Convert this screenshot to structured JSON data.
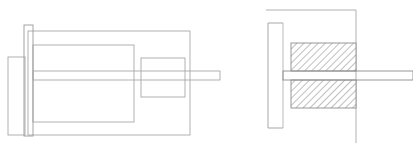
{
  "drawing": {
    "title": "Mechanical Assembly Technical Drawing",
    "description": "Two orthographic engineering views of a shaft-mounted assembly: left side elevation and right sectional view with hatching.",
    "canvas": {
      "width": 413,
      "height": 150,
      "background": "#ffffff"
    },
    "style": {
      "line_color": "#a8a8a8",
      "line_color_dark": "#8d8d8d",
      "hatch_color": "#8a8a8a",
      "fill_color": "#ffffff",
      "stroke_width": 0.9
    },
    "views": [
      {
        "id": "left-elevation-view",
        "name": "Side Elevation View",
        "label": "",
        "parts": [
          {
            "id": "outer-body-rect",
            "name": "outer-body-rectangle",
            "x": 28,
            "y": 31,
            "w": 162,
            "h": 104
          },
          {
            "id": "inner-body-rect",
            "name": "inner-body-rectangle",
            "x": 33,
            "y": 45,
            "w": 101,
            "h": 77
          },
          {
            "id": "mounting-flange-rect",
            "name": "mounting-flange-plate",
            "x": 24,
            "y": 25,
            "w": 9,
            "h": 111
          },
          {
            "id": "rear-housing-rect",
            "name": "rear-housing-block",
            "x": 8,
            "y": 57,
            "w": 17,
            "h": 78
          },
          {
            "id": "boss-rect",
            "name": "shaft-boss-rectangle",
            "x": 141,
            "y": 58,
            "w": 44,
            "h": 39
          },
          {
            "id": "shaft-band",
            "name": "output-shaft",
            "x": 33,
            "y": 71,
            "w": 187,
            "h": 9
          }
        ]
      },
      {
        "id": "right-section-view",
        "name": "Cross Section View",
        "label": "",
        "parts": [
          {
            "id": "datum-top-line",
            "name": "datum-top-horizontal-line",
            "x1": 266,
            "y1": 10,
            "x2": 356,
            "y2": 10
          },
          {
            "id": "datum-right-line",
            "name": "datum-right-vertical-line",
            "x1": 356,
            "y1": 10,
            "x2": 356,
            "y2": 143
          },
          {
            "id": "bracket-top",
            "name": "bracket-top-arm",
            "x1": 268,
            "y1": 23,
            "x2": 283,
            "y2": 23
          },
          {
            "id": "bracket-spine",
            "name": "bracket-vertical-spine",
            "x1": 268,
            "y1": 23,
            "x2": 268,
            "y2": 128
          },
          {
            "id": "bracket-bottom",
            "name": "bracket-bottom-arm",
            "x1": 268,
            "y1": 128,
            "x2": 283,
            "y2": 128
          },
          {
            "id": "inner-wall-line",
            "name": "inner-wall-vertical-line",
            "x1": 283,
            "y1": 23,
            "x2": 283,
            "y2": 128
          },
          {
            "id": "hatch-upper-block",
            "name": "hatched-section-upper",
            "x": 291,
            "y": 43,
            "w": 65,
            "h": 28
          },
          {
            "id": "hatch-lower-block",
            "name": "hatched-section-lower",
            "x": 291,
            "y": 80,
            "w": 65,
            "h": 28
          },
          {
            "id": "section-shaft",
            "name": "section-shaft-band",
            "x": 283,
            "y": 71,
            "w": 130,
            "h": 9
          }
        ],
        "hatch": {
          "angle_degrees": 45,
          "spacing_px": 5,
          "direction": "lower-left to upper-right"
        }
      }
    ]
  }
}
